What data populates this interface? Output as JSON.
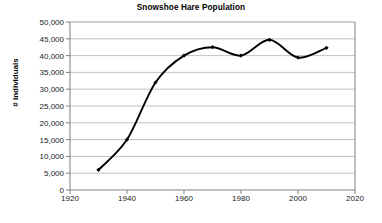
{
  "chart_data": {
    "type": "line",
    "title": "Snowshoe Hare Population",
    "xlabel": "",
    "ylabel": "# individuals",
    "x": [
      1930,
      1940,
      1950,
      1960,
      1970,
      1980,
      1990,
      2000,
      2010
    ],
    "values": [
      6000,
      15000,
      32000,
      40000,
      42500,
      40000,
      44700,
      39400,
      42300
    ],
    "series": [
      {
        "name": "Snowshoe Hare Population",
        "values": [
          6000,
          15000,
          32000,
          40000,
          42500,
          40000,
          44700,
          39400,
          42300
        ]
      }
    ],
    "xlim": [
      1920,
      2020
    ],
    "ylim": [
      0,
      50000
    ],
    "xticks": [
      1920,
      1940,
      1960,
      1980,
      2000,
      2020
    ],
    "xtick_labels": [
      "1920",
      "1940",
      "1960",
      "1980",
      "2000",
      "2020"
    ],
    "yticks": [
      0,
      5000,
      10000,
      15000,
      20000,
      25000,
      30000,
      35000,
      40000,
      45000,
      50000
    ],
    "ytick_labels": [
      "0",
      "5,000",
      "10,000",
      "15,000",
      "20,000",
      "25,000",
      "30,000",
      "35,000",
      "40,000",
      "45,000",
      "50,000"
    ],
    "grid": "horizontal",
    "legend": "none",
    "line_color": "#000000",
    "marker": "diamond",
    "grid_color": "#b3b3b3",
    "axis_color": "#808080",
    "background": "#ffffff"
  }
}
